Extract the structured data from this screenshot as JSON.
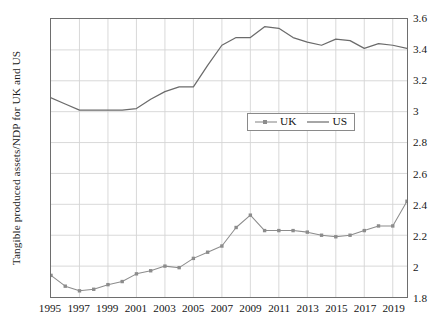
{
  "chart_data": {
    "type": "line",
    "title": "",
    "xlabel": "",
    "ylabel": "Tangible produced assets/NDP for UK and US",
    "xlim": [
      1995,
      2020
    ],
    "ylim": [
      1.8,
      3.6
    ],
    "ytick_step": 0.2,
    "grid": true,
    "legend_position": "center",
    "x": [
      1995,
      1996,
      1997,
      1998,
      1999,
      2000,
      2001,
      2002,
      2003,
      2004,
      2005,
      2006,
      2007,
      2008,
      2009,
      2010,
      2011,
      2012,
      2013,
      2014,
      2015,
      2016,
      2017,
      2018,
      2019,
      2020
    ],
    "x_tick_labels": [
      "1995",
      "1997",
      "1999",
      "2001",
      "2003",
      "2005",
      "2007",
      "2009",
      "2011",
      "2013",
      "2015",
      "2017",
      "2019"
    ],
    "y_tick_labels_left": [
      "3.6",
      "3.4",
      "3.2",
      "3.0",
      "2.8",
      "2.6",
      "2.4",
      "2.2",
      "2.0",
      "1.8"
    ],
    "y_tick_labels_right": [
      "3.6",
      "3.4",
      "3.2",
      "3",
      "2.8",
      "2.6",
      "2.4",
      "2.2",
      "2",
      "1.8"
    ],
    "y_tick_values": [
      3.6,
      3.4,
      3.2,
      3.0,
      2.8,
      2.6,
      2.4,
      2.2,
      2.0,
      1.8
    ],
    "series": [
      {
        "name": "UK",
        "marker": "square",
        "color": "#8c8c8c",
        "values": [
          1.94,
          1.87,
          1.84,
          1.85,
          1.88,
          1.9,
          1.95,
          1.97,
          2.0,
          1.99,
          2.05,
          2.09,
          2.13,
          2.25,
          2.33,
          2.23,
          2.23,
          2.23,
          2.22,
          2.2,
          2.19,
          2.2,
          2.23,
          2.26,
          2.26,
          2.42
        ]
      },
      {
        "name": "US",
        "marker": "none",
        "color": "#6b6b6b",
        "values": [
          3.09,
          3.05,
          3.01,
          3.01,
          3.01,
          3.01,
          3.02,
          3.08,
          3.13,
          3.16,
          3.16,
          3.3,
          3.43,
          3.48,
          3.48,
          3.55,
          3.54,
          3.48,
          3.45,
          3.43,
          3.47,
          3.46,
          3.41,
          3.44,
          3.43,
          3.41
        ]
      }
    ]
  },
  "legend": {
    "items": [
      {
        "label": "UK"
      },
      {
        "label": "US"
      }
    ]
  }
}
